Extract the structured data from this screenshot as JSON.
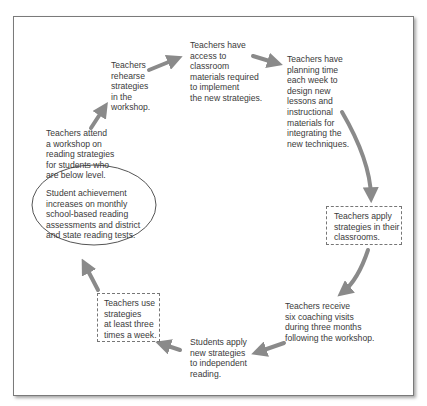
{
  "diagram": {
    "type": "cycle",
    "steps": [
      {
        "id": "attend",
        "text": "Teachers attend\na workshop on\nreading strategies\nfor students who\nare below level."
      },
      {
        "id": "rehearse",
        "text": "Teachers\nrehearse\nstrategies\nin the\nworkshop."
      },
      {
        "id": "access",
        "text": "Teachers have\naccess to\nclassroom\nmaterials required\nto implement\nthe new strategies."
      },
      {
        "id": "planning",
        "text": "Teachers have\nplanning time\neach week to\ndesign new\nlessons and\ninstructional\nmaterials for\nintegrating the\nnew techniques."
      },
      {
        "id": "apply",
        "text": "Teachers apply\nstrategies in their\nclassrooms.",
        "shape": "dashed-box"
      },
      {
        "id": "coaching",
        "text": "Teachers receive\nsix coaching visits\nduring three months\nfollowing the workshop."
      },
      {
        "id": "students",
        "text": "Students apply\nnew strategies\nto independent\nreading."
      },
      {
        "id": "use",
        "text": "Teachers use\nstrategies\nat least three\ntimes a week.",
        "shape": "dashed-box"
      },
      {
        "id": "outcome",
        "text": "Student achievement\nincreases on monthly\nschool-based reading\nassessments and district\nand state reading tests.",
        "shape": "ellipse"
      }
    ],
    "colors": {
      "arrow": "#8a8a8a",
      "text": "#3a3a3a",
      "border": "#7a7a7a"
    }
  }
}
